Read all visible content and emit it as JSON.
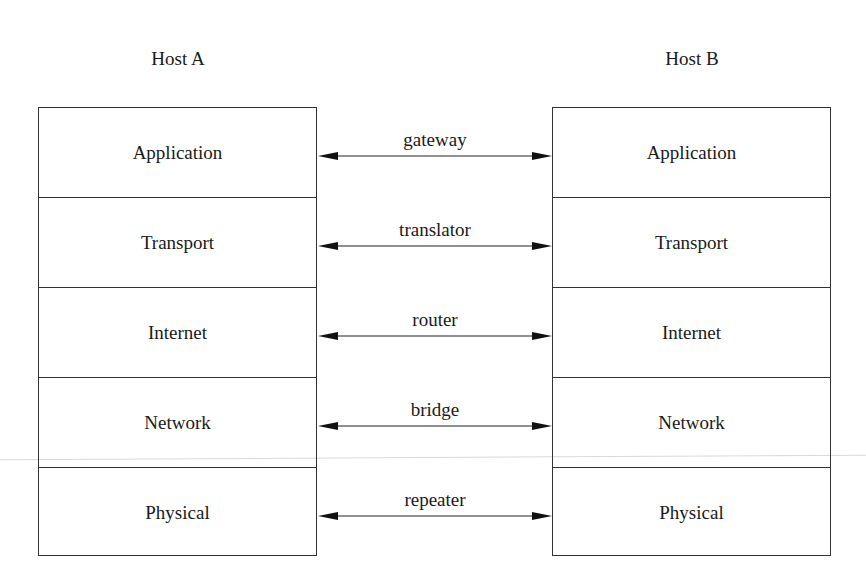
{
  "hosts": [
    {
      "title": "Host A",
      "layers": [
        "Application",
        "Transport",
        "Internet",
        "Network",
        "Physical"
      ]
    },
    {
      "title": "Host B",
      "layers": [
        "Application",
        "Transport",
        "Internet",
        "Network",
        "Physical"
      ]
    }
  ],
  "links": [
    {
      "label": "gateway",
      "between": "Application"
    },
    {
      "label": "translator",
      "between": "Transport"
    },
    {
      "label": "router",
      "between": "Internet"
    },
    {
      "label": "bridge",
      "between": "Network"
    },
    {
      "label": "repeater",
      "between": "Physical"
    }
  ],
  "colors": {
    "line": "#333333",
    "text": "#1a1a1a",
    "background": "#ffffff"
  }
}
